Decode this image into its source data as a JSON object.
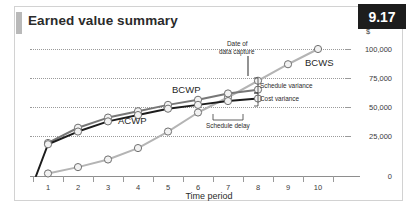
{
  "figure": {
    "title": "Earned value summary",
    "badge": "9.17"
  },
  "chart_data": {
    "type": "line",
    "title": "Earned value summary",
    "xlabel": "Time period",
    "ylabel": "$",
    "x": [
      1,
      2,
      3,
      4,
      5,
      6,
      7,
      8,
      9,
      10
    ],
    "xlim": [
      0.5,
      10.5
    ],
    "ylim": [
      0,
      110000
    ],
    "yticks": [
      0,
      25000,
      50000,
      75000,
      100000
    ],
    "ytick_labels": [
      "0",
      "25,000",
      "50,000",
      "75,000",
      "100,000"
    ],
    "xtick_labels": [
      "1",
      "2",
      "3",
      "4",
      "5",
      "6",
      "7",
      "8",
      "9",
      "10"
    ],
    "grid": true,
    "legend": "inline-labels",
    "series": [
      {
        "name": "BCWS",
        "color": "#b4b4b4",
        "values": [
          2000,
          7000,
          13000,
          22000,
          35000,
          50000,
          62000,
          75000,
          88000,
          100000
        ]
      },
      {
        "name": "BCWP",
        "color": "#777777",
        "values": [
          26000,
          38000,
          46000,
          51000,
          56000,
          60000,
          65000,
          68000,
          null,
          null
        ]
      },
      {
        "name": "ACWP",
        "color": "#1c1c1c",
        "values": [
          25000,
          35000,
          43000,
          48000,
          53000,
          56000,
          59000,
          61000,
          null,
          null
        ]
      }
    ],
    "annotations": [
      {
        "text": "Date of",
        "note": "callout line 1, points to period 8 on BCWS at 75,000"
      },
      {
        "text": "data capture",
        "note": "callout line 2"
      },
      {
        "text": "Schedule variance",
        "note": "bracket between BCWS and BCWP at period 8"
      },
      {
        "text": "Cost variance",
        "note": "bracket between BCWP and ACWP at period 8"
      },
      {
        "text": "Schedule delay",
        "note": "horizontal bracket from period 7 to period 8"
      }
    ],
    "series_labels": [
      "BCWS",
      "BCWP",
      "ACWP"
    ]
  },
  "axis": {
    "y_unit": "$",
    "y_labels": [
      "100,000",
      "75,000",
      "50,000",
      "25,000",
      "0"
    ],
    "x_labels": [
      "1",
      "2",
      "3",
      "4",
      "5",
      "6",
      "7",
      "8",
      "9",
      "10"
    ],
    "x_title": "Time period"
  },
  "annotations": {
    "date_of_capture_l1": "Date of",
    "date_of_capture_l2": "data capture",
    "schedule_variance": "Schedule variance",
    "cost_variance": "Cost variance",
    "schedule_delay": "Schedule delay"
  },
  "series_labels": {
    "bcws": "BCWS",
    "bcwp": "BCWP",
    "acwp": "ACWP"
  },
  "colors": {
    "bcws": "#b4b4b4",
    "bcwp": "#777777",
    "acwp": "#1c1c1c",
    "badge_bg": "#1d1d1d",
    "grid": "#9a9a9a",
    "frame": "#d2d2d2"
  }
}
